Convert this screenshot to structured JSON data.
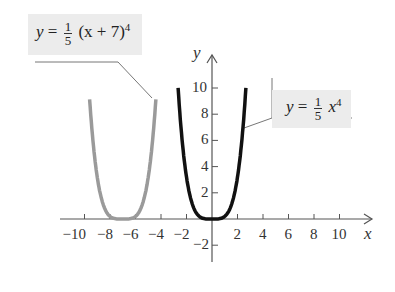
{
  "chart_data": {
    "type": "line",
    "title": "",
    "xlabel": "x",
    "ylabel": "y",
    "xlim": [
      -11.5,
      12.5
    ],
    "ylim": [
      -3,
      10.5
    ],
    "grid": false,
    "x_ticks": [
      -10,
      -8,
      -6,
      -4,
      -2,
      2,
      4,
      6,
      8,
      10
    ],
    "y_ticks": [
      -2,
      2,
      4,
      6,
      8,
      10
    ],
    "x_tick_labels": [
      "−10",
      "−8",
      "−6",
      "−4",
      "−2",
      "2",
      "4",
      "6",
      "8",
      "10"
    ],
    "y_tick_labels": [
      "−2",
      "2",
      "4",
      "6",
      "8",
      "10"
    ],
    "series": [
      {
        "name": "y = 1/5 (x + 7)^4",
        "formula": "y = (1/5)(x+7)^4",
        "color": "#9a9a9a",
        "x_range": [
          -9.6,
          -4.4
        ]
      },
      {
        "name": "y = 1/5 x^4",
        "formula": "y = (1/5)x^4",
        "color": "#111111",
        "x_range": [
          -2.66,
          2.66
        ]
      }
    ],
    "annotations": [
      {
        "text": "y = 1/5 (x + 7)^4",
        "points_to": "gray curve"
      },
      {
        "text": "y = 1/5 x^4",
        "points_to": "black curve"
      }
    ]
  },
  "labels": {
    "shifted": {
      "y": "y",
      "eq": "=",
      "num": "1",
      "den": "5",
      "rest": "(x + 7)",
      "exp": "4"
    },
    "base": {
      "y": "y",
      "eq": "=",
      "num": "1",
      "den": "5",
      "x": "x",
      "exp": "4"
    },
    "x_axis": "x",
    "y_axis": "y"
  }
}
